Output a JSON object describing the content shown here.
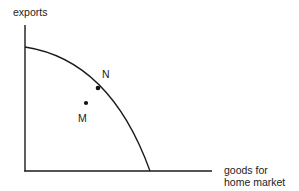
{
  "diagram": {
    "type": "production-possibility-frontier",
    "y_axis_label": "exports",
    "x_axis_label_line1": "goods for",
    "x_axis_label_line2": "home market",
    "points": [
      {
        "label": "N",
        "position": "on curve"
      },
      {
        "label": "M",
        "position": "inside curve"
      }
    ]
  }
}
